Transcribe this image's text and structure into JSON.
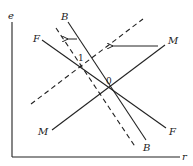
{
  "diagram": {
    "axes": {
      "y_label": "e",
      "x_label": "r"
    },
    "curves": {
      "B_solid": {
        "start_label": "B",
        "end_label": "B",
        "style": "solid"
      },
      "B_shifted": {
        "style": "dashed"
      },
      "F": {
        "start_label": "F",
        "end_label": "F",
        "style": "solid"
      },
      "M_solid": {
        "start_label": "M",
        "end_label": "M",
        "style": "solid"
      },
      "M_shifted": {
        "style": "dashed"
      }
    },
    "points": {
      "new_equilibrium": "1",
      "initial_equilibrium": "0"
    },
    "arrows": [
      {
        "name": "M shift left",
        "direction": "left"
      },
      {
        "name": "B shift left",
        "direction": "left"
      }
    ],
    "colors": {
      "line": "#222222",
      "background": "#ffffff"
    }
  }
}
